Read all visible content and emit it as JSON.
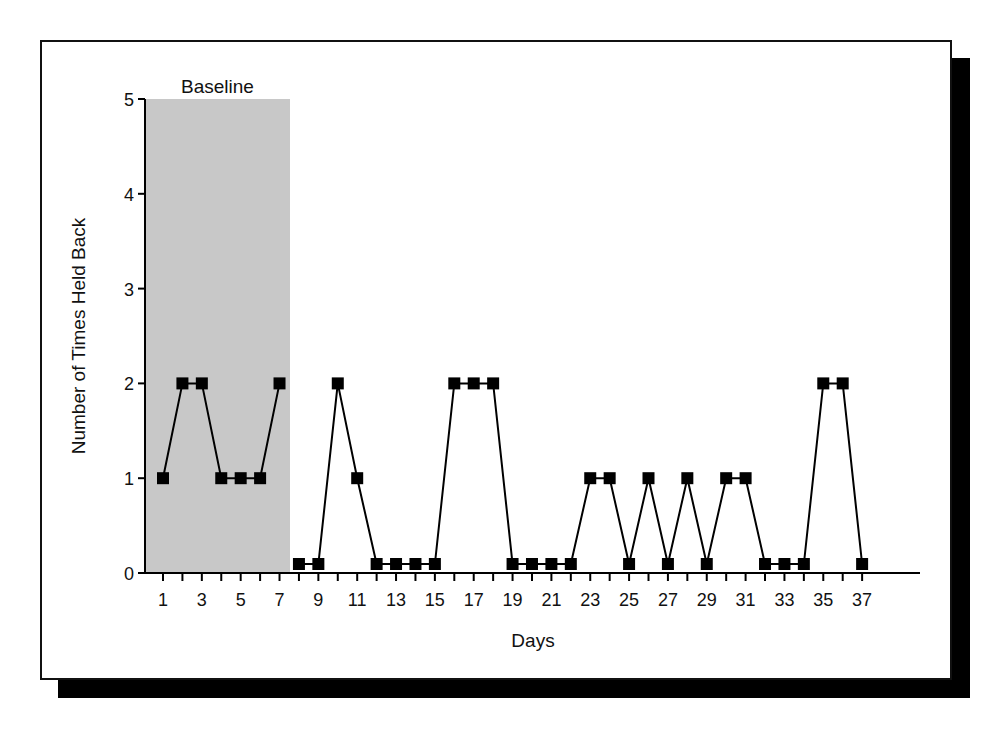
{
  "chart_data": {
    "type": "line",
    "title": "",
    "xlabel": "Days",
    "ylabel": "Number of Times Held Back",
    "ylim": [
      0,
      5
    ],
    "xlim": [
      0,
      40
    ],
    "yticks": [
      0,
      1,
      2,
      3,
      4,
      5
    ],
    "xtick_labels": [
      1,
      3,
      5,
      7,
      9,
      11,
      13,
      15,
      17,
      19,
      21,
      23,
      25,
      27,
      29,
      31,
      33,
      35,
      37
    ],
    "grid": false,
    "legend": null,
    "annotations": [
      {
        "text": "Baseline",
        "type": "shaded-region",
        "x_start": 0,
        "x_end": 7.5,
        "color": "#c8c8c8"
      }
    ],
    "series": [
      {
        "name": "Number of Times Held Back",
        "marker": "square",
        "color": "#000000",
        "segments": [
          {
            "phase": "Baseline",
            "x": [
              1,
              2,
              3,
              4,
              5,
              6,
              7
            ],
            "values": [
              1,
              2,
              2,
              1,
              1,
              1,
              2
            ]
          },
          {
            "phase": "Intervention",
            "x": [
              8,
              9,
              10,
              11,
              12,
              13,
              14,
              15,
              16,
              17,
              18,
              19,
              20,
              21,
              22,
              23,
              24,
              25,
              26,
              27,
              28,
              29,
              30,
              31,
              32,
              33,
              34,
              35,
              36,
              37
            ],
            "values": [
              0,
              0,
              2,
              1,
              0,
              0,
              0,
              0,
              2,
              2,
              2,
              0,
              0,
              0,
              0,
              1,
              1,
              0,
              1,
              0,
              1,
              0,
              1,
              1,
              0,
              0,
              0,
              2,
              2,
              0
            ]
          }
        ]
      }
    ]
  },
  "labels": {
    "baseline": "Baseline",
    "x_axis_title": "Days",
    "y_axis_title": "Number of Times Held Back"
  }
}
